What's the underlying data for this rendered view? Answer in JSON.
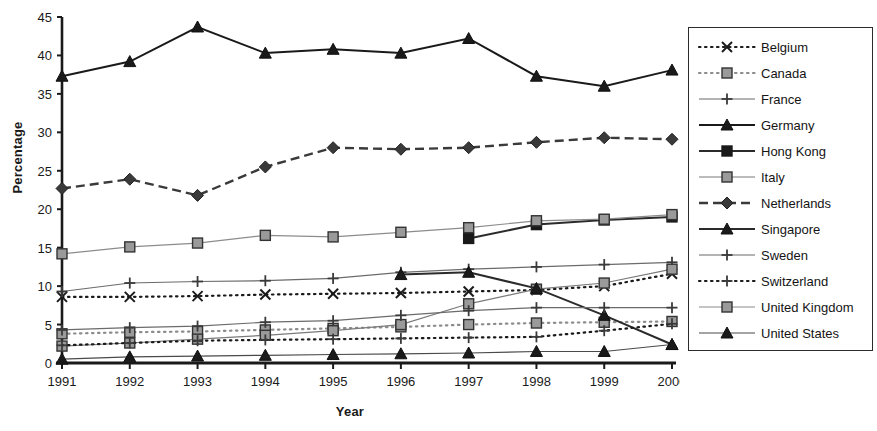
{
  "chart_data": {
    "type": "line",
    "title": "",
    "xlabel": "Year",
    "ylabel": "Percentage",
    "grid": false,
    "legend_position": "right-outside",
    "x": [
      1991,
      1992,
      1993,
      1994,
      1995,
      1996,
      1997,
      1998,
      1999,
      2000
    ],
    "xtick_labels": [
      "1991",
      "1992",
      "1993",
      "1994",
      "1995",
      "1996",
      "1997",
      "1998",
      "1999",
      "2000"
    ],
    "ytick_labels": [
      "0",
      "5",
      "10",
      "15",
      "20",
      "25",
      "30",
      "35",
      "40",
      "45"
    ],
    "yticks": [
      0,
      5,
      10,
      15,
      20,
      25,
      30,
      35,
      40,
      45
    ],
    "ylim": [
      0,
      45
    ],
    "xlim": [
      1991,
      2000
    ],
    "series": [
      {
        "name": "Belgium",
        "marker": "x",
        "line_style": "dotted",
        "color": "#1a1a1a",
        "values": [
          8.6,
          8.6,
          8.7,
          8.9,
          9.0,
          9.1,
          9.3,
          9.5,
          10.0,
          11.6
        ]
      },
      {
        "name": "Canada",
        "marker": "square-gray",
        "line_style": "dotted",
        "color": "#8c8c8c",
        "values": [
          3.8,
          4.0,
          4.1,
          4.3,
          4.5,
          4.7,
          5.0,
          5.2,
          5.3,
          5.4
        ]
      },
      {
        "name": "France",
        "marker": "plus",
        "line_style": "solid-thin",
        "color": "#6b6b6b",
        "values": [
          9.3,
          10.4,
          10.6,
          10.7,
          11.0,
          11.8,
          12.2,
          12.5,
          12.8,
          13.1
        ]
      },
      {
        "name": "Germany",
        "marker": "triangle-filled",
        "line_style": "solid-thick",
        "color": "#1a1a1a",
        "values": [
          37.3,
          39.2,
          43.7,
          40.3,
          40.8,
          40.3,
          42.2,
          37.3,
          36.0,
          38.1
        ]
      },
      {
        "name": "Hong Kong",
        "marker": "square-filled",
        "line_style": "solid-thick",
        "color": "#2b2b2b",
        "values": [
          null,
          null,
          null,
          null,
          null,
          null,
          16.2,
          18.0,
          18.6,
          19.0
        ]
      },
      {
        "name": "Italy",
        "marker": "square-gray",
        "line_style": "solid-thin",
        "color": "#7a7a7a",
        "values": [
          2.2,
          2.6,
          3.1,
          3.6,
          4.2,
          5.0,
          7.7,
          9.6,
          10.4,
          12.2
        ]
      },
      {
        "name": "Netherlands",
        "marker": "diamond-filled",
        "line_style": "dashed",
        "color": "#3a3a3a",
        "values": [
          22.7,
          23.9,
          21.8,
          25.5,
          28.0,
          27.8,
          28.0,
          28.7,
          29.3,
          29.1
        ]
      },
      {
        "name": "Singapore",
        "marker": "triangle-filled",
        "line_style": "solid-thick",
        "color": "#2b2b2b",
        "values": [
          null,
          null,
          null,
          null,
          null,
          11.5,
          11.8,
          9.7,
          6.2,
          2.4
        ]
      },
      {
        "name": "Sweden",
        "marker": "plus",
        "line_style": "solid-thin",
        "color": "#6b6b6b",
        "values": [
          4.3,
          4.6,
          4.8,
          5.3,
          5.5,
          6.2,
          6.8,
          7.2,
          7.2,
          7.2
        ]
      },
      {
        "name": "Switzerland",
        "marker": "plus",
        "line_style": "dotted",
        "color": "#1a1a1a",
        "values": [
          2.3,
          2.6,
          2.9,
          3.0,
          3.1,
          3.2,
          3.3,
          3.4,
          4.2,
          5.1
        ]
      },
      {
        "name": "United Kingdom",
        "marker": "square-gray",
        "line_style": "solid-thin",
        "color": "#8c8c8c",
        "values": [
          14.2,
          15.1,
          15.6,
          16.6,
          16.4,
          17.0,
          17.6,
          18.5,
          18.7,
          19.3
        ]
      },
      {
        "name": "United States",
        "marker": "triangle-filled",
        "line_style": "solid-thin",
        "color": "#4a4a4a",
        "values": [
          0.5,
          0.8,
          0.9,
          1.0,
          1.1,
          1.2,
          1.3,
          1.5,
          1.5,
          2.4
        ]
      }
    ]
  },
  "axis": {
    "y_title": "Percentage",
    "x_title": "Year"
  },
  "legend": {
    "items": [
      {
        "label": "Belgium"
      },
      {
        "label": "Canada"
      },
      {
        "label": "France"
      },
      {
        "label": "Germany"
      },
      {
        "label": "Hong Kong"
      },
      {
        "label": "Italy"
      },
      {
        "label": "Netherlands"
      },
      {
        "label": "Singapore"
      },
      {
        "label": "Sweden"
      },
      {
        "label": "Switzerland"
      },
      {
        "label": "United Kingdom"
      },
      {
        "label": "United States"
      }
    ]
  }
}
